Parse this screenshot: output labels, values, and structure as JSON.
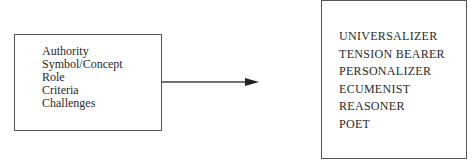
{
  "diagram": {
    "left_box": {
      "items": [
        "Authority",
        "Symbol/Concept",
        "Role",
        "Criteria",
        "Challenges"
      ]
    },
    "right_box": {
      "items": [
        "UNIVERSALIZER",
        "TENSION BEARER",
        "PERSONALIZER",
        "ECUMENIST",
        "REASONER",
        "POET"
      ]
    },
    "connector": {
      "direction": "left-to-right",
      "color": "#444444"
    }
  }
}
